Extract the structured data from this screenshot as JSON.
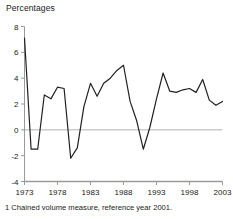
{
  "chart_title": "Percentages",
  "footnote": "1 Chained volume measure, reference year 2001.",
  "colors": {
    "line": "#231f20",
    "axis": "#9a9a9a",
    "zero_line": "#b4b4b4",
    "text": "#1a1a1a",
    "background": "#ffffff"
  },
  "chart_data": {
    "type": "line",
    "title": "Percentages",
    "xlabel": "",
    "ylabel": "Percentages",
    "xlim": [
      1973,
      2003
    ],
    "ylim": [
      -4,
      8
    ],
    "ytick_labels": [
      "8",
      "6",
      "4",
      "2",
      "0",
      "-2",
      "-4"
    ],
    "ytick_values": [
      8,
      6,
      4,
      2,
      0,
      -2,
      -4
    ],
    "xtick_labels": [
      "1973",
      "1978",
      "1983",
      "1988",
      "1993",
      "1998",
      "2003"
    ],
    "xtick_values": [
      1973,
      1978,
      1983,
      1988,
      1993,
      1998,
      2003
    ],
    "grid": false,
    "zero_line": true,
    "legend": null,
    "x": [
      1973,
      1974,
      1975,
      1976,
      1977,
      1978,
      1979,
      1980,
      1981,
      1982,
      1983,
      1984,
      1985,
      1986,
      1987,
      1988,
      1989,
      1990,
      1991,
      1992,
      1993,
      1994,
      1995,
      1996,
      1997,
      1998,
      1999,
      2000,
      2001,
      2002,
      2003
    ],
    "values": [
      7.1,
      -1.5,
      -1.5,
      2.7,
      2.4,
      3.3,
      3.2,
      -2.2,
      -1.4,
      1.8,
      3.6,
      2.6,
      3.6,
      4.0,
      4.6,
      5.0,
      2.2,
      0.7,
      -1.5,
      0.2,
      2.4,
      4.4,
      3.0,
      2.9,
      3.1,
      3.2,
      2.9,
      3.9,
      2.3,
      1.9,
      2.2
    ],
    "series": [
      {
        "name": "Annual growth",
        "values": [
          7.1,
          -1.5,
          -1.5,
          2.7,
          2.4,
          3.3,
          3.2,
          -2.2,
          -1.4,
          1.8,
          3.6,
          2.6,
          3.6,
          4.0,
          4.6,
          5.0,
          2.2,
          0.7,
          -1.5,
          0.2,
          2.4,
          4.4,
          3.0,
          2.9,
          3.1,
          3.2,
          2.9,
          3.9,
          2.3,
          1.9,
          2.2
        ]
      }
    ]
  }
}
